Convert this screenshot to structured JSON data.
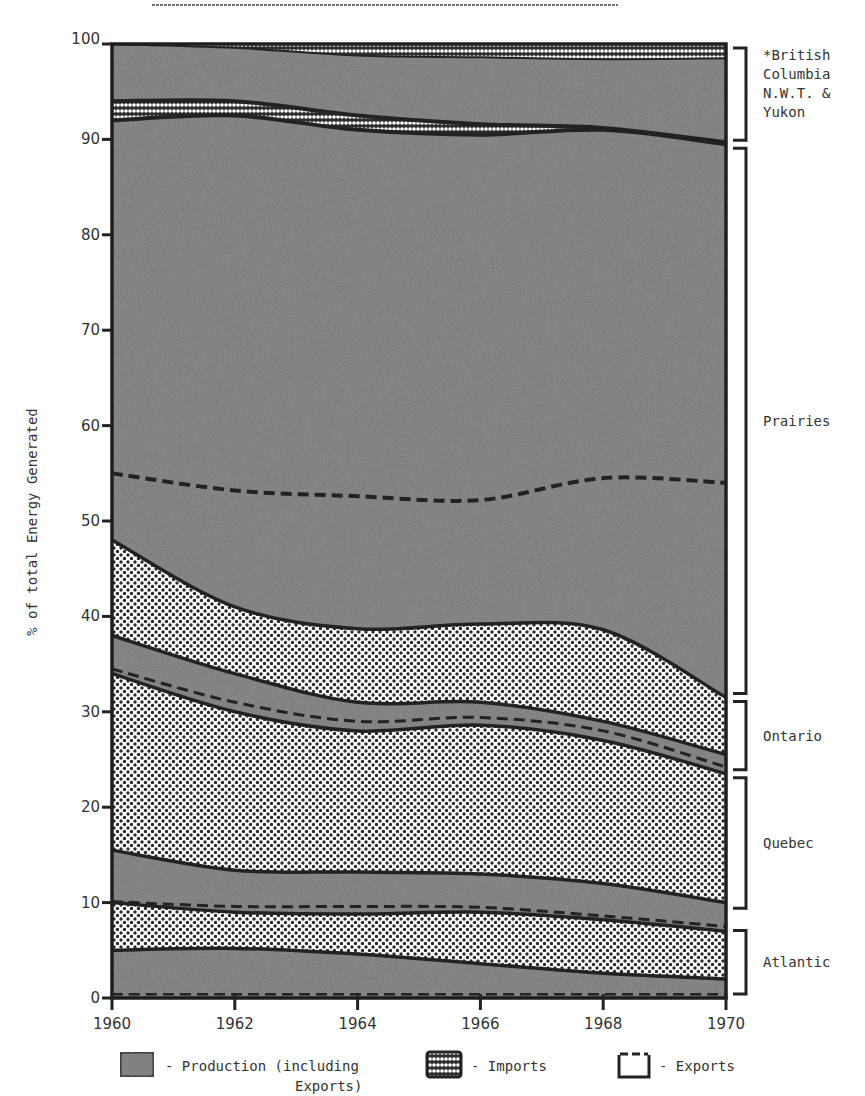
{
  "header": {
    "title_fragment": "1960-1970"
  },
  "chart_data": {
    "type": "area",
    "title": "",
    "xlabel": "",
    "ylabel": "% of total Energy Generated",
    "xlim": [
      1960,
      1970
    ],
    "ylim": [
      0,
      100
    ],
    "x_ticks": [
      "1960",
      "1962",
      "1964",
      "1966",
      "1968",
      "1970"
    ],
    "y_ticks": [
      "0",
      "10",
      "20",
      "30",
      "40",
      "50",
      "60",
      "70",
      "80",
      "90",
      "100"
    ],
    "grid": false,
    "x": [
      1960,
      1962,
      1964,
      1966,
      1968,
      1970
    ],
    "boundaries": {
      "bc_top": [
        100,
        100,
        100,
        100,
        100,
        100
      ],
      "bc_imports_top": [
        100,
        99.6,
        98.8,
        98.6,
        98.4,
        98.5
      ],
      "bc_imports_lower_band_top": [
        94,
        94,
        92.5,
        91.6,
        91.5,
        90.5
      ],
      "bc_imports_lower_band_bottom": [
        92,
        92.5,
        91,
        90.5,
        91.2,
        89.5
      ],
      "bc_bottom": [
        93.8,
        93.5,
        92,
        91.5,
        91,
        89.5
      ],
      "prairies_exports_dashed": [
        55,
        53.2,
        52.6,
        52.2,
        54.5,
        54
      ],
      "prairies_bottom": [
        48,
        41,
        38.7,
        39.2,
        38.6,
        31.5
      ],
      "ontario_production_top": [
        38,
        34,
        31,
        31,
        29,
        25.5
      ],
      "ontario_exports_dashed": [
        34.5,
        31,
        29,
        29.4,
        28,
        24.2
      ],
      "ontario_bottom": [
        34,
        30,
        28,
        28.6,
        27,
        23.5
      ],
      "quebec_imports_bottom": [
        15.5,
        13.4,
        13.2,
        13,
        12,
        10
      ],
      "quebec_exports_dashed": [
        10.1,
        9.6,
        9.6,
        9.5,
        8.6,
        7.5
      ],
      "quebec_bottom": [
        10,
        9,
        8.8,
        9,
        8.2,
        7
      ],
      "atlantic_imports_bottom": [
        5,
        5.2,
        4.6,
        3.6,
        2.6,
        2
      ],
      "atlantic_exports_dashed": [
        0.4,
        0.4,
        0.4,
        0.4,
        0.4,
        0.4
      ],
      "bottom": [
        0,
        0,
        0,
        0,
        0,
        0
      ]
    },
    "series": [
      {
        "name": "British Columbia, N.W.T. & Yukon - Imports",
        "pattern": "imports",
        "values": [
          2.0,
          0.5,
          1.2,
          1.4,
          1.6,
          1.5
        ]
      },
      {
        "name": "British Columbia, N.W.T. & Yukon - Production",
        "pattern": "production",
        "values": [
          6.2,
          6.1,
          6.8,
          7.1,
          7.4,
          9.0
        ]
      },
      {
        "name": "Prairies - Production",
        "pattern": "production",
        "values": [
          45.8,
          52.5,
          53.3,
          52.3,
          52.4,
          58.0
        ]
      },
      {
        "name": "Ontario - Imports",
        "pattern": "imports",
        "values": [
          10.0,
          7.0,
          7.7,
          8.2,
          9.6,
          6.0
        ]
      },
      {
        "name": "Ontario - Production",
        "pattern": "production",
        "values": [
          4.0,
          4.0,
          3.0,
          2.4,
          2.0,
          2.0
        ]
      },
      {
        "name": "Quebec - Imports",
        "pattern": "imports",
        "values": [
          18.5,
          16.6,
          14.8,
          15.6,
          15.0,
          13.5
        ]
      },
      {
        "name": "Quebec - Production",
        "pattern": "production",
        "values": [
          5.5,
          4.4,
          4.4,
          4.0,
          3.8,
          3.0
        ]
      },
      {
        "name": "Atlantic - Imports",
        "pattern": "imports",
        "values": [
          5.0,
          3.8,
          4.2,
          5.4,
          5.6,
          5.0
        ]
      },
      {
        "name": "Atlantic - Production",
        "pattern": "production",
        "values": [
          5.0,
          5.2,
          4.6,
          3.6,
          2.6,
          2.0
        ]
      }
    ],
    "regions": [
      {
        "name": "*British Columbia N.W.T. & Yukon",
        "lines": [
          "*British",
          "Columbia",
          "N.W.T. &",
          "Yukon"
        ],
        "range": [
          89.5,
          100
        ]
      },
      {
        "name": "Prairies",
        "lines": [
          "Prairies"
        ],
        "range": [
          31.5,
          89.5
        ]
      },
      {
        "name": "Ontario",
        "lines": [
          "Ontario"
        ],
        "range": [
          23.5,
          31.5
        ]
      },
      {
        "name": "Quebec",
        "lines": [
          "Quebec"
        ],
        "range": [
          9,
          23.5
        ]
      },
      {
        "name": "Atlantic",
        "lines": [
          "Atlantic"
        ],
        "range": [
          0,
          7.5
        ]
      }
    ],
    "legend": [
      {
        "key": "production",
        "label": "- Production (including",
        "label2": "Exports)"
      },
      {
        "key": "imports",
        "label": "- Imports"
      },
      {
        "key": "exports",
        "label": "- Exports"
      }
    ],
    "legend_position": "bottom"
  },
  "colors": {
    "production_fill": "#7d7d7d",
    "imports_fill": "#ffffff",
    "imports_dot": "#2b2b2b",
    "line": "#222222",
    "text": "#333333"
  }
}
